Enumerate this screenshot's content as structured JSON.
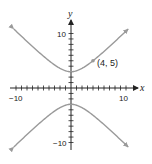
{
  "chart_data": {
    "type": "line",
    "title": "",
    "xlabel": "x",
    "ylabel": "y",
    "xlim": [
      -10,
      10
    ],
    "ylim": [
      -10,
      10
    ],
    "grid": false,
    "tick_step": 1,
    "tick_labels": {
      "x": [
        "-10",
        "10"
      ],
      "y": [
        "10",
        "-10"
      ]
    },
    "series": [
      {
        "name": "hyperbola",
        "equation": "y^2/9 - x^2/9 = 1",
        "branches": [
          "upper",
          "lower"
        ],
        "vertices": [
          [
            0,
            3
          ],
          [
            0,
            -3
          ]
        ],
        "color": "#9a9a9a"
      }
    ],
    "annotations": [
      {
        "point": [
          4,
          5
        ],
        "label": "(4, 5)"
      }
    ]
  },
  "labels": {
    "x_axis": "x",
    "y_axis": "y",
    "x_min": "−10",
    "x_max": "10",
    "y_max": "10",
    "y_min": "−10",
    "point": "(4, 5)"
  },
  "colors": {
    "curve": "#9a9a9a",
    "axis": "#222222"
  }
}
